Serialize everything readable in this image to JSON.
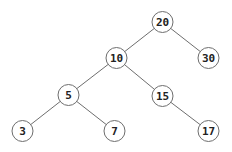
{
  "diagram": {
    "type": "binary-search-tree",
    "node_radius": 10.5,
    "nodes": [
      {
        "id": "n20",
        "label": "20",
        "x": 162.5,
        "y": 22
      },
      {
        "id": "n10",
        "label": "10",
        "x": 116.5,
        "y": 58
      },
      {
        "id": "n30",
        "label": "30",
        "x": 208.5,
        "y": 58
      },
      {
        "id": "n5",
        "label": "5",
        "x": 68.5,
        "y": 95
      },
      {
        "id": "n15",
        "label": "15",
        "x": 162.5,
        "y": 96
      },
      {
        "id": "n3",
        "label": "3",
        "x": 22.5,
        "y": 131
      },
      {
        "id": "n7",
        "label": "7",
        "x": 114.5,
        "y": 131
      },
      {
        "id": "n17",
        "label": "17",
        "x": 208.5,
        "y": 131
      }
    ],
    "edges": [
      {
        "from": "n20",
        "to": "n10"
      },
      {
        "from": "n20",
        "to": "n30"
      },
      {
        "from": "n10",
        "to": "n5"
      },
      {
        "from": "n10",
        "to": "n15"
      },
      {
        "from": "n5",
        "to": "n3"
      },
      {
        "from": "n5",
        "to": "n7"
      },
      {
        "from": "n15",
        "to": "n17"
      }
    ],
    "colors": {
      "edge": "#6e6e6e",
      "node_stroke": "#6e6e6e",
      "node_fill": "#ffffff",
      "label": "#222222"
    }
  }
}
